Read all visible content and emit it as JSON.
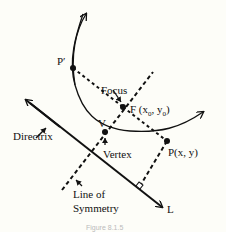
{
  "diagram": {
    "type": "parabola-definition",
    "labels": {
      "p_prime": "P′",
      "focus": "Focus",
      "focus_point": "F (x",
      "focus_sub0": "0",
      "focus_mid": ", y",
      "focus_sub1": "0",
      "focus_close": ")",
      "vertex_point": "V",
      "vertex": "Vertex",
      "point_p": "P(x, y)",
      "directrix": "Directrix",
      "line_of": "Line of",
      "symmetry": "Symmetry",
      "line_l": "L"
    },
    "caption": "Figure 8.1.5",
    "colors": {
      "stroke": "#111111",
      "background": "#fdfdf8",
      "caption": "#bbbbbb"
    }
  }
}
